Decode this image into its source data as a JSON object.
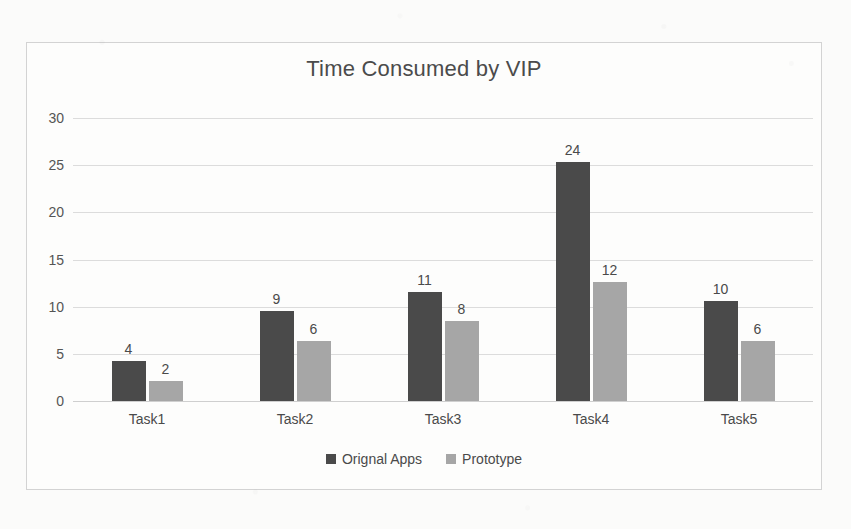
{
  "chart_data": {
    "type": "bar",
    "title": "Time Consumed by VIP",
    "xlabel": "",
    "ylabel": "",
    "categories": [
      "Task1",
      "Task2",
      "Task3",
      "Task4",
      "Task5"
    ],
    "series": [
      {
        "name": "Orignal Apps",
        "color": "#4a4a4a",
        "values": [
          4,
          9,
          11,
          24,
          10
        ]
      },
      {
        "name": "Prototype",
        "color": "#a6a6a6",
        "values": [
          2,
          6,
          8,
          12,
          6
        ]
      }
    ],
    "ylim": [
      0,
      30
    ],
    "yticks": [
      0,
      5,
      10,
      15,
      20,
      25,
      30
    ],
    "ytick_labels": [
      "0",
      "5",
      "10",
      "15",
      "20",
      "25",
      "30"
    ],
    "grid": true,
    "legend_position": "bottom",
    "data_labels": true
  },
  "legend": {
    "items": [
      {
        "label": "Orignal Apps"
      },
      {
        "label": "Prototype"
      }
    ]
  }
}
